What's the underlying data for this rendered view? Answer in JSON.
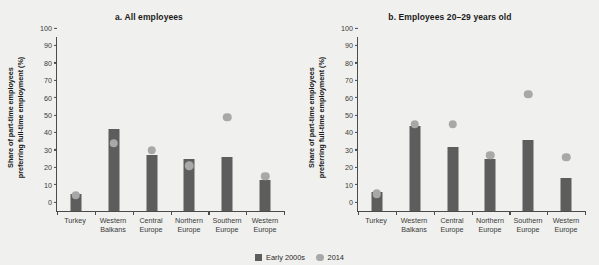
{
  "chart_data": [
    {
      "type": "bar",
      "title": "a. All employees",
      "xlabel": "",
      "ylabel": "Share of part-time employees preferring full-time employment (%)",
      "ylim": [
        0,
        100
      ],
      "ytick_values": [
        0,
        10,
        20,
        30,
        40,
        50,
        60,
        70,
        80,
        90,
        100
      ],
      "grid": false,
      "categories": [
        "Turkey",
        "Western Balkans",
        "Central Europe",
        "Northern Europe",
        "Southern Europe",
        "Western Europe"
      ],
      "series": [
        {
          "name": "Early 2000s",
          "type": "bar",
          "color": "#5d5d5d",
          "values": [
            10,
            47,
            32,
            30,
            31,
            18
          ]
        },
        {
          "name": "2014",
          "type": "scatter",
          "color": "#a8a8a8",
          "values": [
            9,
            39,
            35,
            26,
            54,
            20
          ]
        }
      ]
    },
    {
      "type": "bar",
      "title": "b. Employees 20–29 years old",
      "xlabel": "",
      "ylabel": "Share of part-time employees preferring full-time employment (%)",
      "ylim": [
        0,
        100
      ],
      "ytick_values": [
        0,
        10,
        20,
        30,
        40,
        50,
        60,
        70,
        80,
        90,
        100
      ],
      "grid": false,
      "categories": [
        "Turkey",
        "Western Balkans",
        "Central Europe",
        "Northern Europe",
        "Southern Europe",
        "Western Europe"
      ],
      "series": [
        {
          "name": "Early 2000s",
          "type": "bar",
          "color": "#5d5d5d",
          "values": [
            11,
            49,
            37,
            30,
            41,
            19
          ]
        },
        {
          "name": "2014",
          "type": "scatter",
          "color": "#a8a8a8",
          "values": [
            10,
            50,
            50,
            32,
            67,
            31
          ]
        }
      ]
    }
  ],
  "legend": {
    "position": "bottom-center",
    "items": [
      {
        "label": "Early 2000s",
        "marker": "square",
        "color": "#5d5d5d"
      },
      {
        "label": "2014",
        "marker": "circle",
        "color": "#a8a8a8"
      }
    ]
  },
  "axis_label_lines": {
    "Turkey": [
      "Turkey"
    ],
    "Western Balkans": [
      "Western",
      "Balkans"
    ],
    "Central Europe": [
      "Central",
      "Europe"
    ],
    "Northern Europe": [
      "Northern",
      "Europe"
    ],
    "Southern Europe": [
      "Southern",
      "Europe"
    ],
    "Western Europe": [
      "Western",
      "Europe"
    ]
  },
  "ylabel_lines": [
    "Share of part-time employees",
    "preferring full-time employment (%)"
  ]
}
